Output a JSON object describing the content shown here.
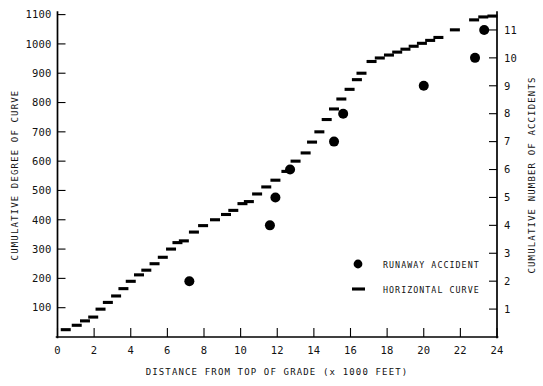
{
  "chart_data": {
    "type": "scatter",
    "title": "",
    "xlabel": "DISTANCE FROM TOP OF GRADE (x 1000 FEET)",
    "ylabel_left": "CUMULATIVE DEGREE OF CURVE",
    "ylabel_right": "CUMULATIVE NUMBER OF ACCIDENTS",
    "xlim": [
      0,
      24
    ],
    "ylim_left": [
      0,
      1100
    ],
    "ylim_right": [
      0,
      11.55
    ],
    "xticks": [
      0,
      2,
      4,
      6,
      8,
      10,
      12,
      14,
      16,
      18,
      20,
      22,
      24
    ],
    "xticklabels": [
      "0",
      "2",
      "4",
      "6",
      "8",
      "10",
      "12",
      "14",
      "16",
      "18",
      "20",
      "22",
      "24"
    ],
    "yticks_left": [
      100,
      200,
      300,
      400,
      500,
      600,
      700,
      800,
      900,
      1000,
      1100
    ],
    "yticklabels_left": [
      "100",
      "200",
      "300",
      "400",
      "500",
      "600",
      "700",
      "800",
      "900",
      "1000",
      "1100"
    ],
    "yticks_right": [
      1,
      2,
      3,
      4,
      5,
      6,
      7,
      8,
      9,
      10,
      11
    ],
    "yticklabels_right": [
      "1",
      "2",
      "3",
      "4",
      "5",
      "6",
      "7",
      "8",
      "9",
      "10",
      "11"
    ],
    "grid": false,
    "legend_position": "center-right",
    "series": [
      {
        "name": "RUNAWAY ACCIDENT",
        "marker": "circle",
        "axis": "right",
        "color": "#000000",
        "points": [
          {
            "x": 7.2,
            "y": 2
          },
          {
            "x": 11.6,
            "y": 4
          },
          {
            "x": 11.9,
            "y": 5
          },
          {
            "x": 12.7,
            "y": 6
          },
          {
            "x": 15.1,
            "y": 7
          },
          {
            "x": 15.6,
            "y": 8
          },
          {
            "x": 20.0,
            "y": 9
          },
          {
            "x": 22.8,
            "y": 10
          },
          {
            "x": 23.3,
            "y": 11
          }
        ]
      },
      {
        "name": "HORIZONTAL CURVE",
        "marker": "dash",
        "axis": "left",
        "color": "#000000",
        "points": [
          {
            "x": 0.45,
            "y": 25
          },
          {
            "x": 1.05,
            "y": 40
          },
          {
            "x": 1.5,
            "y": 55
          },
          {
            "x": 1.95,
            "y": 68
          },
          {
            "x": 2.35,
            "y": 95
          },
          {
            "x": 2.75,
            "y": 118
          },
          {
            "x": 3.2,
            "y": 140
          },
          {
            "x": 3.6,
            "y": 165
          },
          {
            "x": 4.0,
            "y": 190
          },
          {
            "x": 4.45,
            "y": 212
          },
          {
            "x": 4.85,
            "y": 228
          },
          {
            "x": 5.3,
            "y": 250
          },
          {
            "x": 5.75,
            "y": 272
          },
          {
            "x": 6.2,
            "y": 300
          },
          {
            "x": 6.55,
            "y": 322
          },
          {
            "x": 6.9,
            "y": 328
          },
          {
            "x": 7.45,
            "y": 358
          },
          {
            "x": 7.95,
            "y": 380
          },
          {
            "x": 8.6,
            "y": 400
          },
          {
            "x": 9.2,
            "y": 418
          },
          {
            "x": 9.6,
            "y": 432
          },
          {
            "x": 10.1,
            "y": 455
          },
          {
            "x": 10.45,
            "y": 462
          },
          {
            "x": 10.9,
            "y": 488
          },
          {
            "x": 11.4,
            "y": 512
          },
          {
            "x": 11.9,
            "y": 535
          },
          {
            "x": 12.5,
            "y": 565
          },
          {
            "x": 13.0,
            "y": 600
          },
          {
            "x": 13.55,
            "y": 628
          },
          {
            "x": 13.9,
            "y": 665
          },
          {
            "x": 14.3,
            "y": 700
          },
          {
            "x": 14.7,
            "y": 742
          },
          {
            "x": 15.1,
            "y": 778
          },
          {
            "x": 15.5,
            "y": 812
          },
          {
            "x": 15.95,
            "y": 845
          },
          {
            "x": 16.35,
            "y": 878
          },
          {
            "x": 16.6,
            "y": 900
          },
          {
            "x": 17.15,
            "y": 940
          },
          {
            "x": 17.6,
            "y": 952
          },
          {
            "x": 18.1,
            "y": 962
          },
          {
            "x": 18.55,
            "y": 972
          },
          {
            "x": 19.0,
            "y": 982
          },
          {
            "x": 19.45,
            "y": 992
          },
          {
            "x": 19.9,
            "y": 1002
          },
          {
            "x": 20.35,
            "y": 1012
          },
          {
            "x": 20.8,
            "y": 1022
          },
          {
            "x": 21.7,
            "y": 1048
          },
          {
            "x": 22.75,
            "y": 1082
          },
          {
            "x": 23.25,
            "y": 1092
          },
          {
            "x": 23.75,
            "y": 1095
          }
        ]
      }
    ]
  },
  "legend": {
    "items": [
      {
        "label": "RUNAWAY ACCIDENT",
        "marker": "circle"
      },
      {
        "label": "HORIZONTAL CURVE",
        "marker": "dash"
      }
    ]
  }
}
